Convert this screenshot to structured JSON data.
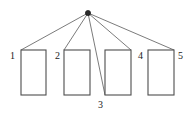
{
  "diagram": {
    "type": "star-fan-topology",
    "canvas": {
      "width": 192,
      "height": 122,
      "background": "#ffffff"
    },
    "colors": {
      "stroke": "#595959",
      "rect_stroke": "#4d4d4d",
      "node_fill": "#2b2b2b",
      "label_text": "#1a1a1a",
      "rect_fill": "#ffffff"
    },
    "apex": {
      "name": "hub-node",
      "cx": 88,
      "cy": 13,
      "r": 2.6
    },
    "rectangles": [
      {
        "id": "rect-1",
        "label": "1",
        "x": 21,
        "y": 50,
        "width": 25,
        "height": 45
      },
      {
        "id": "rect-2",
        "label": "2",
        "x": 64,
        "y": 50,
        "width": 26,
        "height": 45
      },
      {
        "id": "rect-3",
        "label": "3",
        "x": 105,
        "y": 50,
        "width": 26,
        "height": 45
      },
      {
        "id": "rect-4",
        "label": "4",
        "x": 148,
        "y": 50,
        "width": 26,
        "height": 45
      }
    ],
    "rect_fifth": {
      "id": "rect-5",
      "label": "5",
      "x": 148,
      "y": 50,
      "width": 26,
      "height": 45
    },
    "labels": [
      {
        "id": "label-1",
        "text": "1",
        "x": 10,
        "y": 59
      },
      {
        "id": "label-2",
        "text": "2",
        "x": 55,
        "y": 59
      },
      {
        "id": "label-3",
        "text": "3",
        "x": 98,
        "y": 108
      },
      {
        "id": "label-4",
        "text": "4",
        "x": 138,
        "y": 59
      },
      {
        "id": "label-5",
        "text": "5",
        "x": 178,
        "y": 59
      }
    ],
    "connectors": [
      {
        "id": "edge-to-1",
        "x1": 88,
        "y1": 13,
        "x2": 21,
        "y2": 50
      },
      {
        "id": "edge-to-2",
        "x1": 88,
        "y1": 13,
        "x2": 64,
        "y2": 50
      },
      {
        "id": "edge-to-3",
        "x1": 88,
        "y1": 13,
        "x2": 105,
        "y2": 95
      },
      {
        "id": "edge-to-4",
        "x1": 88,
        "y1": 13,
        "x2": 131,
        "y2": 50
      },
      {
        "id": "edge-to-5",
        "x1": 88,
        "y1": 13,
        "x2": 174,
        "y2": 50
      }
    ]
  }
}
